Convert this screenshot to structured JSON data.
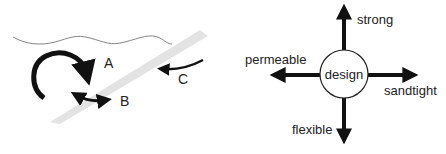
{
  "left_diagram": {
    "labels": {
      "a": "A",
      "b": "B",
      "c": "C"
    },
    "colors": {
      "arrow": "#111111",
      "waterline": "#777777",
      "barrier": "#e3e3e3"
    }
  },
  "right_diagram": {
    "center": "design",
    "axes": {
      "up": "strong",
      "down": "flexible",
      "left": "permeable",
      "right": "sandtight"
    },
    "colors": {
      "arrow": "#111111",
      "circle_fill": "#ffffff",
      "circle_stroke": "#222222"
    }
  }
}
